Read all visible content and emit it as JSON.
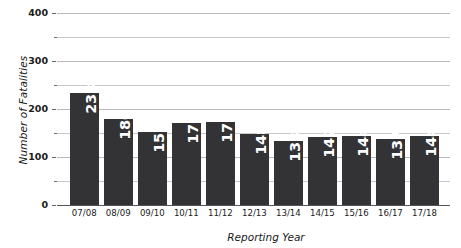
{
  "chart_data": {
    "type": "bar",
    "title": "",
    "xlabel": "Reporting Year",
    "ylabel": "Number of Fatalities",
    "categories": [
      "07/08",
      "08/09",
      "09/10",
      "10/11",
      "11/12",
      "12/13",
      "13/14",
      "14/15",
      "15/16",
      "16/17",
      "17/18"
    ],
    "values": [
      233,
      180,
      152,
      171,
      173,
      148,
      133,
      142,
      144,
      137,
      144
    ],
    "value_labels": [
      "233",
      "180",
      "152",
      "171",
      "173",
      "148",
      "133",
      "142",
      "144",
      "137",
      "144"
    ],
    "ylim": [
      0,
      400
    ],
    "y_major_ticks": [
      0,
      100,
      200,
      300,
      400
    ],
    "y_major_tick_labels": [
      "0",
      "100",
      "200",
      "300",
      "400"
    ],
    "y_minor_ticks": [
      50,
      150,
      250,
      350
    ],
    "grid": true,
    "legend": "none",
    "series": [
      {
        "name": "Number of Fatalities",
        "values": [
          233,
          180,
          152,
          171,
          173,
          148,
          133,
          142,
          144,
          137,
          144
        ]
      }
    ],
    "colors": {
      "bar": "#333336",
      "gridline": "#c9c9cc",
      "axis": "#555558",
      "value_label": "#ffffff",
      "text": "#1a1a1a",
      "background": "#ffffff"
    }
  }
}
